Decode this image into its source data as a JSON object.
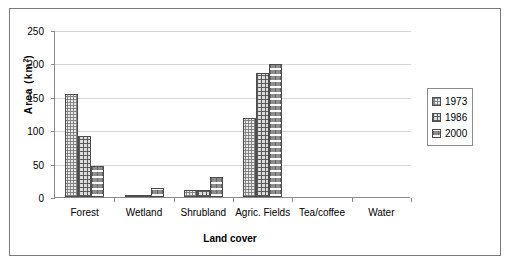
{
  "chart_data": {
    "type": "bar",
    "title": "",
    "subtitle": "",
    "xlabel": "Land cover",
    "ylabel": "Area (km2)",
    "ylabel_base": "Area (km",
    "ylabel_sup": "2",
    "ylabel_close": ")",
    "categories": [
      "Forest",
      "Wetland",
      "Shrubland",
      "Agric. Fields",
      "Tea/coffee",
      "Water"
    ],
    "series": [
      {
        "name": "1973",
        "values": [
          154,
          3,
          11,
          119,
          0,
          0
        ],
        "pattern": "fine-checker",
        "color": "#e8e8e8"
      },
      {
        "name": "1986",
        "values": [
          92,
          2,
          10,
          185,
          0,
          0
        ],
        "pattern": "grid-hatch",
        "color": "#dcdcdc"
      },
      {
        "name": "2000",
        "values": [
          47,
          13,
          30,
          199,
          0,
          0
        ],
        "pattern": "dark-dash",
        "color": "#8e8e8e"
      }
    ],
    "ylim": [
      0,
      250
    ],
    "yticks": [
      0,
      50,
      100,
      150,
      200,
      250
    ],
    "ytick_labels": [
      "0",
      "50",
      "100",
      "150",
      "200",
      "250"
    ],
    "grid": true,
    "grid_axis": "y",
    "legend_position": "right",
    "legend_entries": [
      "1973",
      "1986",
      "2000"
    ],
    "border": true,
    "axis_color": "#8a8a8a",
    "grid_color": "#d6d6d6",
    "frame_color": "#7b7b7b"
  }
}
